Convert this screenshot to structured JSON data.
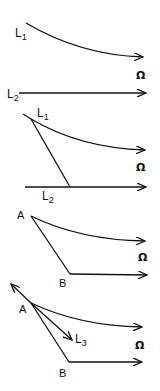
{
  "figure": {
    "panels": [
      {
        "id": "panel-1",
        "labels": {
          "L1_main": "L",
          "L1_sub": "1",
          "omega": "Ω",
          "L2_main": "L",
          "L2_sub": "2"
        }
      },
      {
        "id": "panel-2",
        "labels": {
          "L1_main": "L",
          "L1_sub": "1",
          "omega": "Ω",
          "L2_main": "L",
          "L2_sub": "2"
        }
      },
      {
        "id": "panel-3",
        "labels": {
          "A": "A",
          "B": "B",
          "omega": "Ω"
        }
      },
      {
        "id": "panel-4",
        "labels": {
          "A": "A",
          "B": "B",
          "L3_main": "L",
          "L3_sub": "3",
          "omega": "Ω"
        }
      }
    ]
  },
  "colors": {
    "ink": "#111111",
    "background": "#ffffff"
  }
}
